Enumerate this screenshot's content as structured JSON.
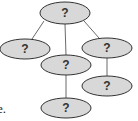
{
  "diagram": {
    "type": "tree",
    "colors": {
      "node_fill": "#d8d8d8",
      "node_stroke": "#333333",
      "edge": "#6a6a6a",
      "text": "#333333"
    },
    "nodes": [
      {
        "id": "root",
        "label": "?",
        "cx": 65,
        "cy": 13,
        "rx": 25,
        "ry": 11
      },
      {
        "id": "left",
        "label": "?",
        "cx": 25,
        "cy": 49,
        "rx": 25,
        "ry": 10
      },
      {
        "id": "middle",
        "label": "?",
        "cx": 66,
        "cy": 65,
        "rx": 25,
        "ry": 10
      },
      {
        "id": "right",
        "label": "?",
        "cx": 107,
        "cy": 48,
        "rx": 25,
        "ry": 10
      },
      {
        "id": "middle-child",
        "label": "?",
        "cx": 66,
        "cy": 108,
        "rx": 25,
        "ry": 10
      },
      {
        "id": "right-child",
        "label": "?",
        "cx": 107,
        "cy": 86,
        "rx": 25,
        "ry": 10
      }
    ],
    "edges": [
      {
        "from": "root",
        "to": "left"
      },
      {
        "from": "root",
        "to": "middle"
      },
      {
        "from": "root",
        "to": "right"
      },
      {
        "from": "middle",
        "to": "middle-child"
      },
      {
        "from": "right",
        "to": "right-child"
      }
    ]
  },
  "clipped_text": "e."
}
